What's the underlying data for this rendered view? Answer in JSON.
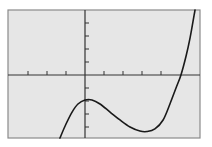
{
  "chart_data": {
    "type": "line",
    "title": "",
    "xlabel": "",
    "ylabel": "",
    "grid": false,
    "legend": null,
    "xlim": [
      -4,
      6
    ],
    "ylim": [
      -5,
      5
    ],
    "x_tick_step": 1,
    "y_tick_step": 1,
    "x_ticks": [
      -3,
      -2,
      -1,
      1,
      2,
      3,
      4
    ],
    "y_ticks": [
      4,
      3,
      2,
      1,
      -1,
      -2,
      -3,
      -4
    ],
    "series": [
      {
        "name": "f(x)",
        "x": [
          -1.32,
          -1.0,
          -0.68,
          -0.37,
          0.0,
          0.37,
          0.79,
          1.32,
          1.84,
          2.37,
          2.89,
          3.26,
          3.68,
          4.11,
          4.47,
          4.79,
          5.05,
          5.32,
          5.53,
          5.79
        ],
        "y": [
          -4.85,
          -3.77,
          -2.85,
          -2.23,
          -1.92,
          -1.92,
          -2.23,
          -2.85,
          -3.46,
          -4.0,
          -4.31,
          -4.35,
          -4.15,
          -3.46,
          -2.23,
          -1.0,
          0.0,
          1.46,
          2.85,
          5.0
        ]
      }
    ],
    "key_points": {
      "local_max": [
        0.2,
        -1.9
      ],
      "local_min": [
        3.3,
        -4.35
      ],
      "x_intercept": [
        5.05,
        0
      ]
    },
    "colors": {
      "plot_background": "#e6e6e6",
      "frame": "#8a8a8a",
      "axes": "#333333",
      "curve": "#1a1a1a"
    }
  }
}
